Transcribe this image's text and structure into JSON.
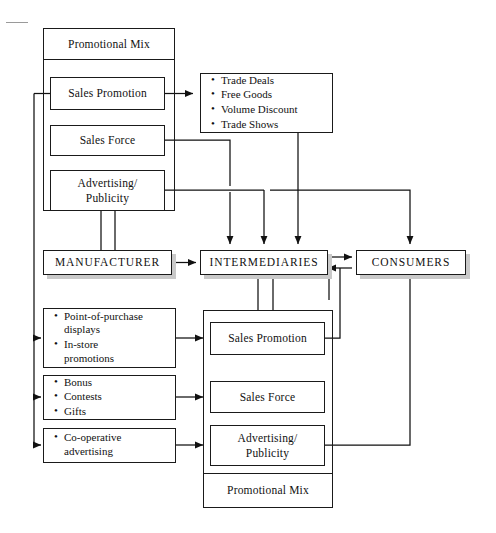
{
  "diagram": {
    "type": "flow-diagram"
  },
  "top_panel": {
    "header_label": "Promotional Mix",
    "items": [
      {
        "label": "Sales Promotion"
      },
      {
        "label": "Sales Force"
      },
      {
        "label": "Advertising/\nPublicity"
      }
    ]
  },
  "trade_list": {
    "bullets": [
      "Trade Deals",
      "Free Goods",
      "Volume Discount",
      "Trade Shows"
    ]
  },
  "chain": {
    "manufacturer": "MANUFACTURER",
    "intermediaries": "INTERMEDIARIES",
    "consumers": "CONSUMERS"
  },
  "consumer_lists": [
    {
      "bullets": [
        "Point-of-purchase\ndisplays",
        "In-store\npromotions"
      ]
    },
    {
      "bullets": [
        "Bonus",
        "Contests",
        "Gifts"
      ]
    },
    {
      "bullets": [
        "Co-operative\nadvertising"
      ]
    }
  ],
  "bottom_panel": {
    "items": [
      {
        "label": "Sales Promotion"
      },
      {
        "label": "Sales Force"
      },
      {
        "label": "Advertising/\nPublicity"
      }
    ],
    "footer_label": "Promotional Mix"
  },
  "colors": {
    "stroke": "#1a1a1a",
    "shadow": "#c9c9c9",
    "text": "#111111",
    "background": "#ffffff"
  }
}
